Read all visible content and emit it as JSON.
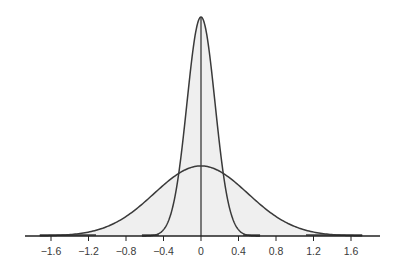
{
  "chart_data": {
    "type": "area",
    "title": "",
    "xlabel": "",
    "ylabel": "",
    "xlim": [
      -1.85,
      1.9
    ],
    "x_ticks": [
      -1.6,
      -1.2,
      -0.8,
      -0.4,
      0,
      0.4,
      0.8,
      1.2,
      1.6
    ],
    "x_tick_labels": [
      "−1.6",
      "−1.2",
      "−0.8",
      "−0.4",
      "0",
      "0.4",
      "0.8",
      "1.2",
      "1.6"
    ],
    "grid": false,
    "legend": null,
    "series": [
      {
        "name": "narrow-normal-curve",
        "distribution": "normal",
        "mean": 0,
        "sd": 0.15,
        "relative_peak_height": 1.0,
        "fill": "#f0f0f0",
        "stroke": "#3a3a3a"
      },
      {
        "name": "wide-normal-curve",
        "distribution": "normal",
        "mean": 0,
        "sd": 0.5,
        "relative_peak_height": 0.32,
        "fill": "#f0f0f0",
        "stroke": "#3a3a3a"
      }
    ],
    "annotations": [
      {
        "type": "vertical-line",
        "x": 0,
        "description": "mean line from axis to narrow peak"
      }
    ]
  },
  "style": {
    "curve_color": "#3a3a3a",
    "fill_color": "#efefef",
    "axis_color": "#222222"
  }
}
